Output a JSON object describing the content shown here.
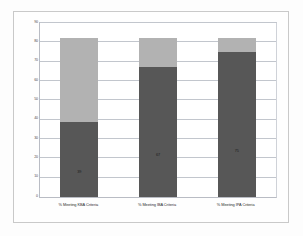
{
  "chart_data": {
    "type": "bar",
    "subtype": "stacked-bar",
    "title": "",
    "subtitle": "",
    "xlabel": "",
    "ylabel": "",
    "ylim": [
      0,
      90
    ],
    "ytick_labels": [
      "90",
      "80",
      "70",
      "60",
      "50",
      "40",
      "30",
      "20",
      "10",
      "0"
    ],
    "ytick_values": [
      90,
      80,
      70,
      60,
      50,
      40,
      30,
      20,
      10,
      0
    ],
    "ytick_step": 10,
    "grid": true,
    "grid_axis": "y",
    "legend": false,
    "legend_position": "none",
    "categories": [
      "% Meeting KBA Criteria",
      "% Meeting IBA Criteria",
      "% Meeting IPA Criteria"
    ],
    "series": [
      {
        "name": "Lower segment",
        "color": "#575757",
        "values": [
          39,
          67,
          75
        ],
        "labels": [
          "39",
          "67",
          "75"
        ]
      },
      {
        "name": "Upper segment",
        "color": "#b2b2b2",
        "values": [
          43,
          15,
          7
        ],
        "labels": [
          "",
          "",
          ""
        ]
      }
    ],
    "totals": [
      82,
      82,
      82
    ],
    "colors": {
      "segment_bottom": "#575757",
      "segment_top": "#b2b2b2",
      "gridline": "#c2c6cd",
      "plot_border": "#b9bcc4",
      "figure_border": "#c9c9c9",
      "background": "#ffffff"
    }
  }
}
